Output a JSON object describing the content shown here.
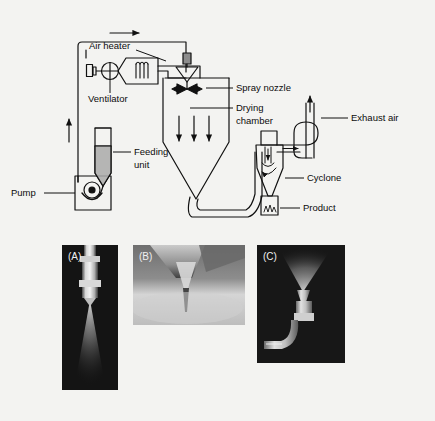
{
  "figure": {
    "background_color": "#f3f3f1",
    "line_color": "#111111",
    "type": "process-flow-schematic",
    "title_visible": false
  },
  "schematic": {
    "labels": {
      "air_heater": "Air heater",
      "ventilator": "Ventilator",
      "spray_nozzle": "Spray nozzle",
      "drying_chamber_line1": "Drying",
      "drying_chamber_line2": "chamber",
      "exhaust_air": "Exhaust air",
      "cyclone": "Cyclone",
      "product": "Product",
      "feeding_unit_line1": "Feeding",
      "feeding_unit_line2": "unit",
      "pump": "Pump"
    },
    "components": [
      {
        "name": "air-heater",
        "label": "Air heater"
      },
      {
        "name": "ventilator",
        "label": "Ventilator"
      },
      {
        "name": "spray-nozzle",
        "label": "Spray nozzle"
      },
      {
        "name": "drying-chamber",
        "label": "Drying chamber"
      },
      {
        "name": "cyclone",
        "label": "Cyclone"
      },
      {
        "name": "product-collector",
        "label": "Product"
      },
      {
        "name": "feeding-unit",
        "label": "Feeding unit"
      },
      {
        "name": "pump",
        "label": "Pump"
      },
      {
        "name": "exhaust-stack",
        "label": "Exhaust air"
      }
    ],
    "flow_arrows": [
      "air-inlet-right",
      "feed-riser-up",
      "chamber-down-1",
      "chamber-down-2",
      "chamber-down-3",
      "cyclone-inlet-right",
      "cyclone-vortex-down",
      "exhaust-up"
    ]
  },
  "photos": {
    "panels": [
      {
        "tag": "(A)",
        "name": "photo-panel-a",
        "caption_tag": "(A)",
        "tone": "dark",
        "subject": "two-fluid nozzle with conical spray"
      },
      {
        "tag": "(B)",
        "name": "photo-panel-b",
        "caption_tag": "(B)",
        "tone": "light",
        "subject": "nozzle tip close-up with fine mist"
      },
      {
        "tag": "(C)",
        "name": "photo-panel-c",
        "caption_tag": "(C)",
        "tone": "dark",
        "subject": "curved lance nozzle with upward plume"
      }
    ]
  }
}
